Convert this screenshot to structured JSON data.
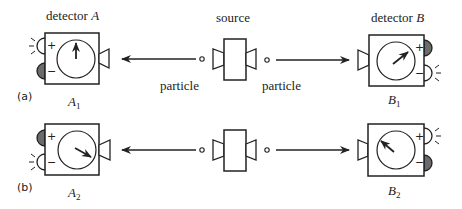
{
  "labels": {
    "detector_a": "detector ",
    "detector_a_var": "A",
    "detector_b": "detector ",
    "detector_b_var": "B",
    "source": "source",
    "particle_left": "particle",
    "particle_right": "particle",
    "panel_a": "(a)",
    "panel_b": "(b)",
    "a1": "A",
    "a1_sub": "1",
    "b1": "B",
    "b1_sub": "1",
    "a2": "A",
    "a2_sub": "2",
    "b2": "B",
    "b2_sub": "2",
    "plus": "+",
    "minus": "−"
  },
  "rows": [
    {
      "panel": "(a)",
      "detector_a": {
        "name": "A1",
        "needle": "up",
        "lit_lamp": "plus",
        "dark_lamp": "minus"
      },
      "detector_b": {
        "name": "B1",
        "needle": "upper-right",
        "lit_lamp": "minus",
        "dark_lamp": "plus"
      }
    },
    {
      "panel": "(b)",
      "detector_a": {
        "name": "A2",
        "needle": "lower-right",
        "lit_lamp": "minus",
        "dark_lamp": "plus"
      },
      "detector_b": {
        "name": "B2",
        "needle": "upper-left",
        "lit_lamp": "plus",
        "dark_lamp": "minus"
      }
    }
  ],
  "colors": {
    "stroke": "#222222",
    "dark_lamp": "#6b6b6b",
    "background": "#ffffff"
  }
}
